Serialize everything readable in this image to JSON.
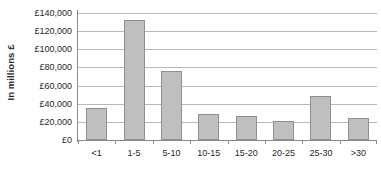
{
  "chart_data": {
    "type": "bar",
    "title": "",
    "subtitle": "",
    "xlabel": "",
    "ylabel": "In millions £",
    "categories": [
      "<1",
      "1-5",
      "5-10",
      "10-15",
      "15-20",
      "20-25",
      "25-30",
      ">30"
    ],
    "values": [
      35000,
      132000,
      76000,
      29000,
      27000,
      21000,
      48000,
      24000
    ],
    "series": [
      {
        "name": "",
        "values": [
          35000,
          132000,
          76000,
          29000,
          27000,
          21000,
          48000,
          24000
        ]
      }
    ],
    "ylim": [
      0,
      140000
    ],
    "ytick_values": [
      0,
      20000,
      40000,
      60000,
      80000,
      100000,
      120000,
      140000
    ],
    "ytick_labels": [
      "£0",
      "£20,000",
      "£40,000",
      "£60,000",
      "£80,000",
      "£100,000",
      "£120,000",
      "£140,000"
    ],
    "grid": true,
    "grid_axis": "y",
    "legend": false,
    "legend_position": "none",
    "annotations": [],
    "colors": {
      "bar_fill": "#bfbfbf",
      "bar_border": "#8f8f8f",
      "gridline": "#b9b9b9",
      "axis": "#8a8a8a",
      "text": "#1f1f1f",
      "background": "#ffffff"
    }
  }
}
